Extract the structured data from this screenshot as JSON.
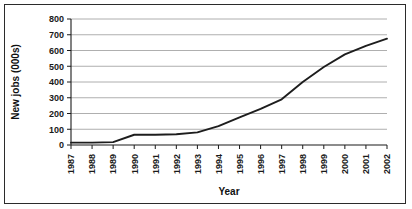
{
  "chart_data": {
    "type": "line",
    "title": "",
    "xlabel": "Year",
    "ylabel": "New jobs (000s)",
    "categories": [
      "1987",
      "1988",
      "1989",
      "1990",
      "1991",
      "1992",
      "1993",
      "1994",
      "1995",
      "1996",
      "1997",
      "1998",
      "1999",
      "2000",
      "2001",
      "2002"
    ],
    "values": [
      15,
      15,
      18,
      65,
      65,
      68,
      80,
      120,
      175,
      230,
      290,
      400,
      495,
      575,
      630,
      675
    ],
    "ylim": [
      0,
      800
    ],
    "ytick_labels": [
      "0",
      "100",
      "200",
      "300",
      "400",
      "500",
      "600",
      "700",
      "800"
    ],
    "ytick_values": [
      0,
      100,
      200,
      300,
      400,
      500,
      600,
      700,
      800
    ],
    "grid": true,
    "grid_axis": "y",
    "legend": false,
    "legend_position": "none",
    "line_color": "#1d1d1d",
    "grid_color": "#9a9a9a",
    "axis_color": "#1a1a1a",
    "background_color": "#ffffff",
    "border_color": "#2b2b2b"
  },
  "axes": {
    "y_title": "New jobs (000s)",
    "x_title": "Year"
  }
}
